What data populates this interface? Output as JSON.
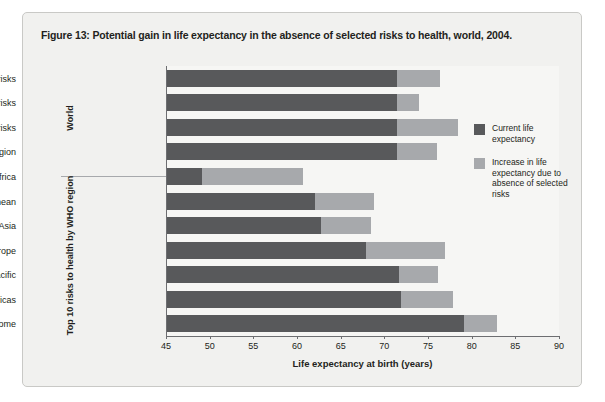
{
  "figure": {
    "title": "Figure 13: Potential gain in life expectancy in the absence of selected risks to health, world, 2004."
  },
  "colors": {
    "current": "#58595b",
    "increase": "#a7a9ac",
    "panel_bg": "#f1f1ef",
    "plot_bg": "#f6f6f4",
    "axis": "#6d6e71",
    "text": "#231f20"
  },
  "groups": [
    {
      "label": "World"
    },
    {
      "label": "Top 10 risks to health by WHO region"
    }
  ],
  "legend": {
    "position": "right",
    "items": [
      {
        "swatch": "#58595b",
        "label": "Current life expectancy"
      },
      {
        "swatch": "#a7a9ac",
        "label": "Increase in life expectancy due to absence of selected risks"
      }
    ]
  },
  "chart_data": {
    "type": "bar",
    "orientation": "horizontal",
    "stacked": true,
    "title": "Figure 13: Potential gain in life expectancy in the absence of selected risks to health, world, 2004.",
    "xlabel": "Life expectancy at birth (years)",
    "ylabel": "",
    "xlim": [
      45,
      90
    ],
    "xticks": [
      45,
      50,
      55,
      60,
      65,
      70,
      75,
      80,
      85,
      90
    ],
    "grid": false,
    "categories": [
      "Eight cardiovascular risks",
      "Seven child risks",
      "All 24 risks",
      "Top 10 risks by region",
      "Africa",
      "Eastern Mediterranean",
      "South-East Asia",
      "Europe",
      "Western Pacific",
      "Americas",
      "High income"
    ],
    "category_groups": [
      "World",
      "World",
      "World",
      "World",
      "Top 10 risks to health by WHO region",
      "Top 10 risks to health by WHO region",
      "Top 10 risks to health by WHO region",
      "Top 10 risks to health by WHO region",
      "Top 10 risks to health by WHO region",
      "Top 10 risks to health by WHO region",
      "Top 10 risks to health by WHO region"
    ],
    "series": [
      {
        "name": "Current life expectancy",
        "color": "#58595b",
        "values": [
          71.5,
          71.5,
          71.5,
          71.5,
          49.1,
          62.1,
          62.7,
          67.9,
          71.7,
          71.9,
          79.1
        ]
      },
      {
        "name": "Increase in life expectancy due to absence of selected risks",
        "color": "#a7a9ac",
        "values": [
          4.9,
          2.5,
          6.9,
          4.5,
          11.6,
          6.7,
          5.8,
          9.0,
          4.5,
          6.0,
          3.8
        ]
      }
    ],
    "totals": [
      76.4,
      74.0,
      78.4,
      76.0,
      60.7,
      68.8,
      68.5,
      76.9,
      76.2,
      77.9,
      82.9
    ]
  }
}
